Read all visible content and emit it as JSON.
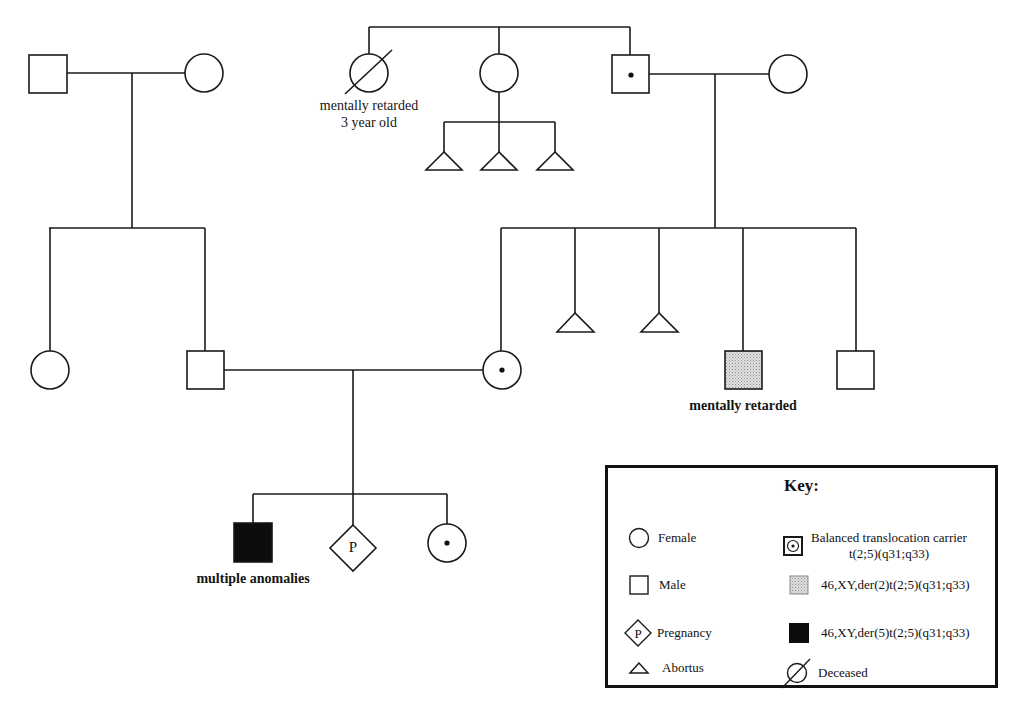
{
  "figure": {
    "type": "pedigree",
    "generations": [
      {
        "id": "I",
        "individuals": [
          {
            "id": "I-1",
            "sex": "male",
            "status": "unaffected"
          },
          {
            "id": "I-2",
            "sex": "female",
            "status": "unaffected"
          },
          {
            "id": "I-3",
            "sex": "female",
            "status": "deceased",
            "label": [
              "mentally retarded",
              "3 year old"
            ]
          },
          {
            "id": "I-4",
            "sex": "female",
            "status": "unaffected",
            "offspring": [
              "abortus",
              "abortus",
              "abortus"
            ]
          },
          {
            "id": "I-5",
            "sex": "male",
            "status": "balanced translocation carrier"
          },
          {
            "id": "I-6",
            "sex": "female",
            "status": "unaffected"
          }
        ]
      },
      {
        "id": "II",
        "individuals": [
          {
            "id": "II-1",
            "sex": "female",
            "status": "unaffected"
          },
          {
            "id": "II-2",
            "sex": "male",
            "status": "unaffected"
          },
          {
            "id": "II-3",
            "sex": "female",
            "status": "balanced translocation carrier"
          },
          {
            "id": "II-4",
            "sex": "unknown",
            "status": "abortus"
          },
          {
            "id": "II-5",
            "sex": "unknown",
            "status": "abortus"
          },
          {
            "id": "II-6",
            "sex": "male",
            "status": "46,XY,der(2)t(2;5)(q31;q33)",
            "label": "mentally retarded"
          },
          {
            "id": "II-7",
            "sex": "male",
            "status": "unaffected"
          }
        ]
      },
      {
        "id": "III",
        "individuals": [
          {
            "id": "III-1",
            "sex": "male",
            "status": "46,XY,der(5)t(2;5)(q31;q33)",
            "label": "multiple anomalies"
          },
          {
            "id": "III-2",
            "sex": "unknown",
            "status": "pregnancy",
            "symbol_text": "P"
          },
          {
            "id": "III-3",
            "sex": "female",
            "status": "balanced translocation carrier"
          }
        ]
      }
    ]
  },
  "labels": {
    "deceased_aunt_line1": "mentally retarded",
    "deceased_aunt_line2": "3 year old",
    "uncle": "mentally retarded",
    "proband": "multiple anomalies",
    "pregnancy_symbol": "P"
  },
  "legend": {
    "title": "Key:",
    "items": [
      {
        "symbol": "female-circle",
        "label": "Female"
      },
      {
        "symbol": "male-square",
        "label": "Male"
      },
      {
        "symbol": "pregnancy-diamond",
        "symbol_text": "P",
        "label": "Pregnancy"
      },
      {
        "symbol": "abortus-triangle",
        "label": "Abortus"
      },
      {
        "symbol": "carrier-dot-square",
        "label_line1": "Balanced translocation carrier",
        "label_line2": "t(2;5)(q31;q33)"
      },
      {
        "symbol": "stippled-square",
        "label": "46,XY,der(2)t(2;5)(q31;q33)"
      },
      {
        "symbol": "filled-square",
        "label": "46,XY,der(5)t(2;5)(q31;q33)"
      },
      {
        "symbol": "deceased-slashed-circle",
        "label": "Deceased"
      }
    ]
  },
  "colors": {
    "line": "#1a1a1a",
    "background": "#ffffff",
    "stipple": "#c8c8c8",
    "affected_fill": "#0d0d0d"
  }
}
